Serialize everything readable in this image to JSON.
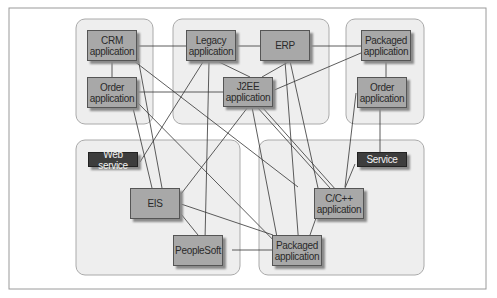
{
  "diagram": {
    "groups": [
      {
        "id": "top-left"
      },
      {
        "id": "top-middle"
      },
      {
        "id": "top-right"
      },
      {
        "id": "bottom-left"
      },
      {
        "id": "bottom-right"
      }
    ],
    "nodes": {
      "crm": "CRM\napplication",
      "order_left": "Order\napplication",
      "legacy": "Legacy\napplication",
      "erp": "ERP",
      "j2ee": "J2EE\napplication",
      "packaged_top": "Packaged\napplication",
      "order_right": "Order\napplication",
      "web_service": "Web service",
      "eis": "EIS",
      "peoplesoft": "PeopleSoft",
      "service": "Service",
      "cpp": "C/C++\napplication",
      "packaged_bottom": "Packaged\napplication"
    },
    "colors": {
      "node": "#a8a8a8",
      "dark_node": "#3d3d3d",
      "group": "#eeeeee",
      "line": "#333333"
    }
  }
}
